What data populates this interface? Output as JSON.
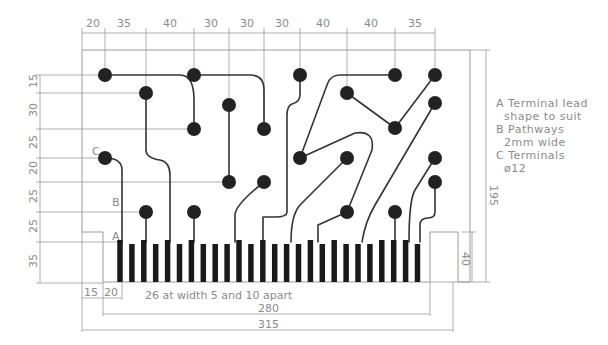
{
  "drawing": {
    "title": "PCB edge connector layout",
    "top_dimensions": [
      "20",
      "35",
      "40",
      "30",
      "30",
      "30",
      "40",
      "40",
      "35"
    ],
    "left_dimensions": [
      "15",
      "30",
      "25",
      "20",
      "25",
      "25",
      "35"
    ],
    "right_dimensions": {
      "overall_height": "195",
      "finger_height": "40"
    },
    "bottom_dimensions": {
      "offset1": "15",
      "offset2": "20",
      "finger_spec": "26 at width 5 and 10 apart",
      "fingers_span": "280",
      "overall_width": "315"
    },
    "callouts": {
      "A": "A",
      "B": "B",
      "C": "C"
    },
    "notes": [
      "A Terminal lead",
      "  shape to suit",
      "B Pathways",
      "  2mm wide",
      "C Terminals",
      "  ø12"
    ],
    "finger_count": 26,
    "colors": {
      "ink": "#1a1a1a",
      "dimension": "#9a9a9a",
      "text": "#8a8a8a",
      "background": "#ffffff"
    }
  }
}
